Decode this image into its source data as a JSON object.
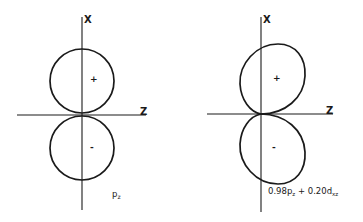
{
  "figures": [
    {
      "id": "left",
      "x_axis_label": "X",
      "z_axis_label": "Z",
      "upper_sign": "+",
      "lower_sign": "-",
      "caption_main": "p",
      "caption_sub": "z"
    },
    {
      "id": "right",
      "x_axis_label": "X",
      "z_axis_label": "Z",
      "upper_sign": "+",
      "lower_sign": "-",
      "caption_parts": {
        "coef1": "0.98p",
        "sub1": "z",
        "plus": " + ",
        "coef2": "0.20d",
        "sub2": "xz"
      }
    }
  ],
  "colors": {
    "ink": "#1a1a1a",
    "background": "#ffffff"
  }
}
